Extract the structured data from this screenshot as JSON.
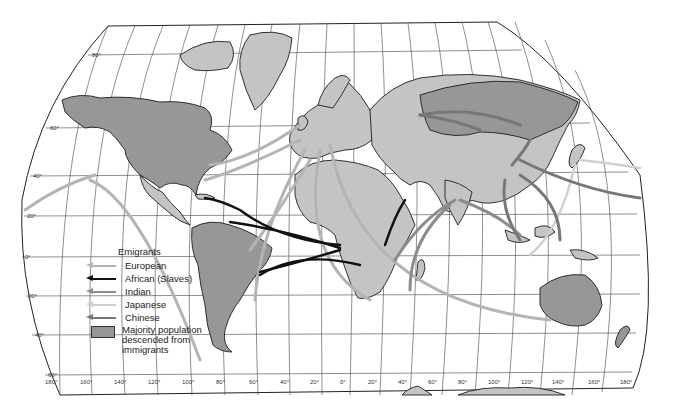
{
  "map": {
    "type": "world migration map",
    "projection": "pseudo-cylindrical world map with graticule",
    "latitude_labels": [
      "80°",
      "60°",
      "40°",
      "20°",
      "0°",
      "20°",
      "40°",
      "60°"
    ],
    "longitude_labels": [
      "180°",
      "160°",
      "140°",
      "120°",
      "100°",
      "80°",
      "60°",
      "40°",
      "20°",
      "0°",
      "20°",
      "40°",
      "60°",
      "80°",
      "100°",
      "120°",
      "140°",
      "160°",
      "180°"
    ]
  },
  "legend": {
    "title": "Emigrants",
    "items": [
      {
        "label": "European",
        "color": "#b4b4b4"
      },
      {
        "label": "African (Slaves)",
        "color": "#111111"
      },
      {
        "label": "Indian",
        "color": "#8c8c8c"
      },
      {
        "label": "Japanese",
        "color": "#cfcfcf"
      },
      {
        "label": "Chinese",
        "color": "#777777"
      }
    ],
    "swatch": {
      "label": "Majority population descended from immigrants",
      "color": "#979797"
    }
  },
  "colors": {
    "land": "#c4c4c4",
    "immigrant_majority": "#979797",
    "ocean": "#ffffff",
    "grid": "#444444"
  }
}
